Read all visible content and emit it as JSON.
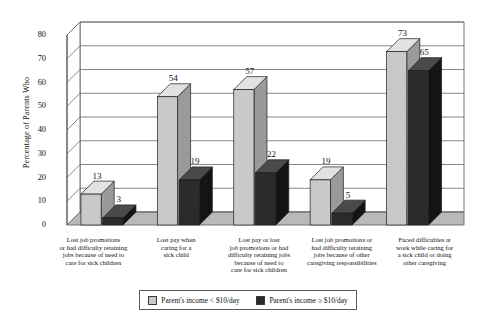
{
  "chart_data": {
    "type": "bar",
    "title": "",
    "xlabel": "",
    "ylabel": "Percentage of Parents Who",
    "ylim": [
      0,
      80
    ],
    "ytick_step": 10,
    "yticks": [
      "80",
      "70",
      "60",
      "50",
      "40",
      "30",
      "20",
      "10",
      "0"
    ],
    "grid": true,
    "legend_position": "bottom",
    "style": "3d-column",
    "categories": [
      "Lost job promotions or had difficulty retaining jobs because of need to care for sick children",
      "Lost pay when caring for a sick child",
      "Lost pay or lost job promotions or had difficulty retaining jobs because of need to care for sick children",
      "Lost job promotions or had difficulty retaining jobs because of other caregiving responsibilities",
      "Faced difficulties at work while caring for a sick child or doing other caregiving"
    ],
    "category_lines": [
      [
        "Lost job promotions",
        "or had difficulty retaining",
        "jobs because of need to",
        "care for sick children"
      ],
      [
        "Lost pay when",
        "caring for a",
        "sick child"
      ],
      [
        "Lost pay or lost",
        "job promotions or had",
        "difficulty retaining jobs",
        "because of need to",
        "care for sick children"
      ],
      [
        "Lost job promotions or",
        "had difficulty retaining",
        "jobs because of other",
        "caregiving responsibilities"
      ],
      [
        "Faced difficulties at",
        "work while caring for",
        "a sick child or doing",
        "other caregiving"
      ]
    ],
    "series": [
      {
        "name": "Parent's income < $10/day",
        "color": "#c9c9c9",
        "values": [
          13,
          54,
          57,
          19,
          73
        ]
      },
      {
        "name": "Parent's income ≥ $10/day",
        "color": "#2b2b2b",
        "values": [
          3,
          19,
          22,
          5,
          65
        ]
      }
    ]
  },
  "legend": {
    "items": [
      {
        "label": "Parent's income < $10/day",
        "swatch": "light"
      },
      {
        "label": "Parent's income ≥ $10/day",
        "swatch": "dark"
      }
    ]
  }
}
